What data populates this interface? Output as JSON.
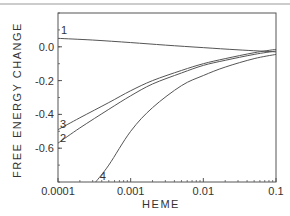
{
  "chart_data": {
    "type": "line",
    "title": "",
    "xlabel": "HEME",
    "ylabel": "FREE ENERGY CHANGE",
    "xscale": "log",
    "xlim": [
      0.0001,
      0.1
    ],
    "ylim": [
      -0.8,
      0.2
    ],
    "grid": false,
    "legend": "inline-labels",
    "xticks": [
      {
        "value": 0.0001,
        "label": "0.0001"
      },
      {
        "value": 0.001,
        "label": "0.001"
      },
      {
        "value": 0.01,
        "label": "0.01"
      },
      {
        "value": 0.1,
        "label": "0.1"
      }
    ],
    "yticks": [
      {
        "value": 0.0,
        "label": "0.0"
      },
      {
        "value": -0.2,
        "label": "-0.2"
      },
      {
        "value": -0.4,
        "label": "-0.4"
      },
      {
        "value": -0.6,
        "label": "-0.6"
      }
    ],
    "series": [
      {
        "name": "1",
        "x": [
          0.0001,
          0.0003,
          0.001,
          0.003,
          0.01,
          0.03,
          0.1
        ],
        "y": [
          0.05,
          0.04,
          0.025,
          0.01,
          -0.005,
          -0.018,
          -0.03
        ]
      },
      {
        "name": "3",
        "x": [
          0.0001,
          0.0002,
          0.0005,
          0.001,
          0.002,
          0.005,
          0.01,
          0.02,
          0.05,
          0.1
        ],
        "y": [
          -0.49,
          -0.42,
          -0.33,
          -0.26,
          -0.2,
          -0.14,
          -0.1,
          -0.07,
          -0.035,
          -0.015
        ]
      },
      {
        "name": "2",
        "x": [
          0.0001,
          0.0002,
          0.0005,
          0.001,
          0.002,
          0.005,
          0.01,
          0.02,
          0.05,
          0.1
        ],
        "y": [
          -0.57,
          -0.48,
          -0.37,
          -0.29,
          -0.22,
          -0.155,
          -0.11,
          -0.08,
          -0.045,
          -0.025
        ]
      },
      {
        "name": "4",
        "x": [
          0.00033,
          0.0005,
          0.001,
          0.002,
          0.005,
          0.01,
          0.02,
          0.05,
          0.1
        ],
        "y": [
          -0.8,
          -0.7,
          -0.5,
          -0.36,
          -0.23,
          -0.17,
          -0.12,
          -0.07,
          -0.045
        ]
      }
    ],
    "curve_labels": [
      {
        "series": "1",
        "text": "1",
        "anchor_x": 0.0001,
        "anchor_y": 0.05
      },
      {
        "series": "3",
        "text": "3",
        "anchor_x": 0.0001,
        "anchor_y": -0.49
      },
      {
        "series": "2",
        "text": "2",
        "anchor_x": 0.0001,
        "anchor_y": -0.57
      },
      {
        "series": "4",
        "text": "4",
        "anchor_x": 0.00033,
        "anchor_y": -0.8
      }
    ]
  },
  "colors": {
    "line": "#555555",
    "axis": "#555555",
    "text": "#333333"
  }
}
